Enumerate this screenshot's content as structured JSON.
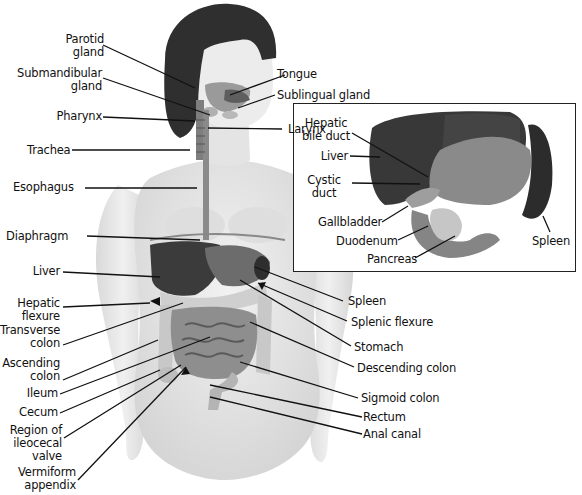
{
  "figure": {
    "labels_left": [
      {
        "id": "parotid-gland",
        "text": "Parotid\ngland"
      },
      {
        "id": "submandibular-gland",
        "text": "Submandibular\ngland"
      },
      {
        "id": "pharynx",
        "text": "Pharynx"
      },
      {
        "id": "trachea",
        "text": "Trachea"
      },
      {
        "id": "esophagus",
        "text": "Esophagus"
      },
      {
        "id": "diaphragm",
        "text": "Diaphragm"
      },
      {
        "id": "liver",
        "text": "Liver"
      },
      {
        "id": "hepatic-flexure",
        "text": "Hepatic\nflexure"
      },
      {
        "id": "transverse-colon",
        "text": "Transverse\ncolon"
      },
      {
        "id": "ascending-colon",
        "text": "Ascending\ncolon"
      },
      {
        "id": "ileum",
        "text": "Ileum"
      },
      {
        "id": "cecum",
        "text": "Cecum"
      },
      {
        "id": "ileocecal-valve",
        "text": "Region of\nileocecal\nvalve"
      },
      {
        "id": "vermiform-appendix",
        "text": "Vermiform\nappendix"
      }
    ],
    "labels_right": [
      {
        "id": "tongue",
        "text": "Tongue"
      },
      {
        "id": "sublingual-gland",
        "text": "Sublingual gland"
      },
      {
        "id": "larynx",
        "text": "Larynx"
      },
      {
        "id": "spleen",
        "text": "Spleen"
      },
      {
        "id": "splenic-flexure",
        "text": "Splenic flexure"
      },
      {
        "id": "stomach",
        "text": "Stomach"
      },
      {
        "id": "descending-colon",
        "text": "Descending colon"
      },
      {
        "id": "sigmoid-colon",
        "text": "Sigmoid colon"
      },
      {
        "id": "rectum",
        "text": "Rectum"
      },
      {
        "id": "anal-canal",
        "text": "Anal canal"
      }
    ],
    "inset": {
      "labels": [
        {
          "id": "hepatic-bile-duct",
          "text": "Hepatic\nbile duct"
        },
        {
          "id": "inset-liver",
          "text": "Liver"
        },
        {
          "id": "cystic-duct",
          "text": "Cystic\nduct"
        },
        {
          "id": "gallbladder",
          "text": "Gallbladder"
        },
        {
          "id": "duodenum",
          "text": "Duodenum"
        },
        {
          "id": "pancreas",
          "text": "Pancreas"
        },
        {
          "id": "inset-spleen",
          "text": "Spleen"
        }
      ]
    },
    "colors": {
      "skin": "#e6e6e6",
      "hair": "#2e2e2e",
      "liver": "#3a3a3a",
      "stomach": "#7a7a7a",
      "intestine": "#8c8c8c",
      "colon": "#c4c4c4",
      "leader": "#111111"
    }
  }
}
